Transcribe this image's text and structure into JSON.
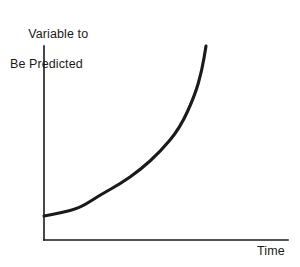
{
  "chart_data": {
    "type": "line",
    "title": "",
    "subtitle": "",
    "ylabel_line1": "Variable to",
    "ylabel_line2": "Be Predicted",
    "ylabel": "Variable to Be Predicted",
    "xlabel": "Time",
    "grid": false,
    "legend": null,
    "axis_ticks": false,
    "tick_labels": [],
    "annotations": [],
    "line_color": "#1a1a1a",
    "axis_color": "#1a1a1a",
    "background_color": "#ffffff",
    "xlim": [
      0,
      1
    ],
    "ylim": [
      0,
      1
    ],
    "x": [
      0.0,
      0.1,
      0.2,
      0.3,
      0.4,
      0.5,
      0.6,
      0.7,
      0.8,
      0.9,
      1.0
    ],
    "y": [
      0.12,
      0.14,
      0.17,
      0.21,
      0.26,
      0.33,
      0.42,
      0.53,
      0.67,
      0.83,
      1.0
    ],
    "curve_path_points": [
      [
        44,
        216
      ],
      [
        60,
        213
      ],
      [
        80,
        208
      ],
      [
        100,
        195
      ],
      [
        120,
        184
      ],
      [
        140,
        170
      ],
      [
        160,
        152
      ],
      [
        180,
        128
      ],
      [
        195,
        95
      ],
      [
        202,
        70
      ],
      [
        206,
        46
      ]
    ],
    "axes": {
      "y_axis": {
        "x": 44,
        "y_top": 46,
        "y_bottom": 240
      },
      "x_axis": {
        "y": 240,
        "x_left": 44,
        "x_right": 288
      }
    }
  }
}
